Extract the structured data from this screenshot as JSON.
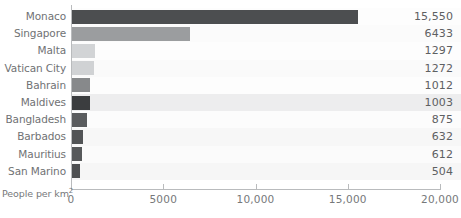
{
  "chart_data": {
    "type": "bar",
    "orientation": "horizontal",
    "title": "",
    "subtitle": "",
    "xlabel": "People per km²",
    "ylabel": "",
    "categories": [
      "Monaco",
      "Singapore",
      "Malta",
      "Vatican City",
      "Bahrain",
      "Maldives",
      "Bangladesh",
      "Barbados",
      "Mauritius",
      "San Marino"
    ],
    "values": [
      15550,
      6433,
      1297,
      1272,
      1012,
      1003,
      875,
      632,
      612,
      504
    ],
    "value_labels": [
      "15,550",
      "6433",
      "1297",
      "1272",
      "1012",
      "1003",
      "875",
      "632",
      "612",
      "504"
    ],
    "bar_colors": [
      "#4c4e50",
      "#9b9d9f",
      "#d2d4d6",
      "#d0d2d4",
      "#87898b",
      "#3b3d3f",
      "#5a5c5e",
      "#525456",
      "#57595b",
      "#4e5052"
    ],
    "row_band_colors": [
      "#fdfdfd",
      "#fbfbfb",
      "#fdfdfd",
      "#fafafa",
      "#fdfdfd",
      "#ededee",
      "#fcfcfc",
      "#f7f7f7",
      "#fbfbfb",
      "#f6f6f6"
    ],
    "xlim": [
      0,
      20000
    ],
    "xticks": [
      0,
      5000,
      10000,
      15000,
      20000
    ],
    "xtick_labels": [
      "0",
      "5000",
      "10,000",
      "15,000",
      "20,000"
    ],
    "grid": false,
    "legend": "none"
  },
  "colors": {
    "axis": "#b9bbbd",
    "text": "#6f7173",
    "background": "#ffffff"
  }
}
